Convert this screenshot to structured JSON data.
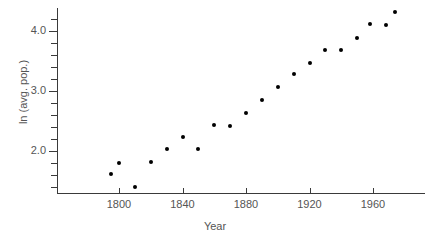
{
  "chart_data": {
    "type": "scatter",
    "title": "",
    "xlabel": "Year",
    "ylabel": "ln (avg. pop.)",
    "xlim": [
      1786,
      1978
    ],
    "ylim": [
      1.25,
      4.4
    ],
    "xticks": [
      1800,
      1840,
      1880,
      1920,
      1960
    ],
    "xtick_labels": [
      "1800",
      "1840",
      "1880",
      "1920",
      "1960"
    ],
    "yticks": [
      2.0,
      3.0,
      4.0
    ],
    "ytick_labels": [
      "2.0",
      "3.0",
      "4.0"
    ],
    "yminorticks": [
      1.4,
      1.6,
      1.8,
      2.2,
      2.4,
      2.6,
      2.8,
      3.2,
      3.4,
      3.6,
      3.8,
      4.2
    ],
    "grid": false,
    "legend": null,
    "marker": "filled-circle",
    "marker_color": "#000000",
    "axis_color": "#3a3a3a",
    "x": [
      1795,
      1800,
      1810,
      1820,
      1830,
      1840,
      1850,
      1860,
      1870,
      1880,
      1890,
      1900,
      1910,
      1920,
      1930,
      1940,
      1950,
      1958,
      1968,
      1974
    ],
    "y": [
      1.62,
      1.8,
      1.4,
      1.82,
      2.04,
      2.24,
      2.03,
      2.44,
      2.42,
      2.64,
      2.85,
      3.07,
      3.28,
      3.46,
      3.68,
      3.68,
      3.89,
      4.12,
      4.1,
      4.31
    ],
    "points": [
      {
        "x": 1795,
        "y": 1.62
      },
      {
        "x": 1800,
        "y": 1.8
      },
      {
        "x": 1810,
        "y": 1.4
      },
      {
        "x": 1820,
        "y": 1.82
      },
      {
        "x": 1830,
        "y": 2.04
      },
      {
        "x": 1840,
        "y": 2.24
      },
      {
        "x": 1850,
        "y": 2.03
      },
      {
        "x": 1860,
        "y": 2.44
      },
      {
        "x": 1870,
        "y": 2.42
      },
      {
        "x": 1880,
        "y": 2.64
      },
      {
        "x": 1890,
        "y": 2.85
      },
      {
        "x": 1900,
        "y": 3.07
      },
      {
        "x": 1910,
        "y": 3.28
      },
      {
        "x": 1920,
        "y": 3.46
      },
      {
        "x": 1930,
        "y": 3.68
      },
      {
        "x": 1940,
        "y": 3.68
      },
      {
        "x": 1950,
        "y": 3.89
      },
      {
        "x": 1958,
        "y": 4.12
      },
      {
        "x": 1968,
        "y": 4.1
      },
      {
        "x": 1974,
        "y": 4.31
      }
    ]
  }
}
